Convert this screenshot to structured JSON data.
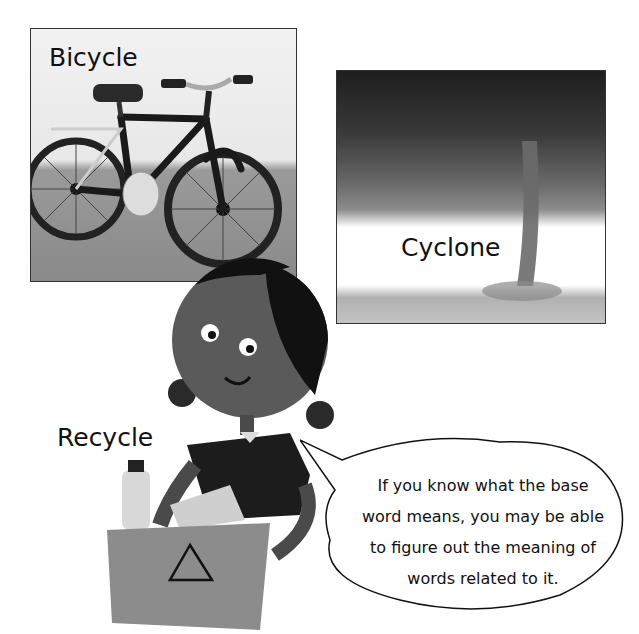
{
  "panels": {
    "bicycle": {
      "label": "Bicycle",
      "image": "bicycle-illustration"
    },
    "cyclone": {
      "label": "Cyclone",
      "image": "tornado-illustration"
    }
  },
  "character": {
    "label": "Recycle",
    "image": "girl-holding-recycling-bin",
    "bin_icon": "recycle-symbol-icon"
  },
  "speech_bubble": {
    "lines": [
      "If you know what the base",
      "word means, you may be able",
      "to figure out the meaning of",
      "words related to it."
    ]
  },
  "colors": {
    "ink": "#111111",
    "border": "#333333",
    "background": "#ffffff"
  }
}
